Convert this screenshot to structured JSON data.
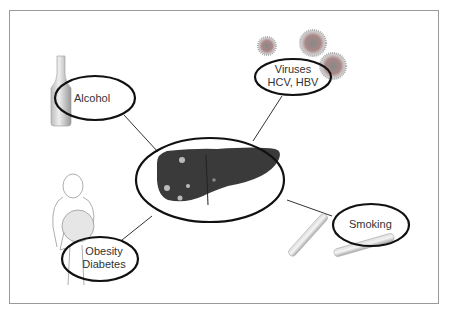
{
  "diagram": {
    "center": {
      "label": "Liver",
      "icon": "liver-icon"
    },
    "nodes": [
      {
        "id": "alcohol",
        "lines": [
          "Alcohol"
        ],
        "icon": "bottle-icon"
      },
      {
        "id": "viruses",
        "lines": [
          "Viruses",
          "HCV, HBV"
        ],
        "icon": "virus-icon"
      },
      {
        "id": "obesity",
        "lines": [
          "Obesity",
          "Diabetes"
        ],
        "icon": "obese-person-icon"
      },
      {
        "id": "smoking",
        "lines": [
          "Smoking"
        ],
        "icon": "cigarette-icon"
      }
    ],
    "colors": {
      "ellipse_stroke": "#111111",
      "connector": "#333333",
      "frame": "#9a9a9a",
      "liver": "#3a3a3a"
    }
  }
}
